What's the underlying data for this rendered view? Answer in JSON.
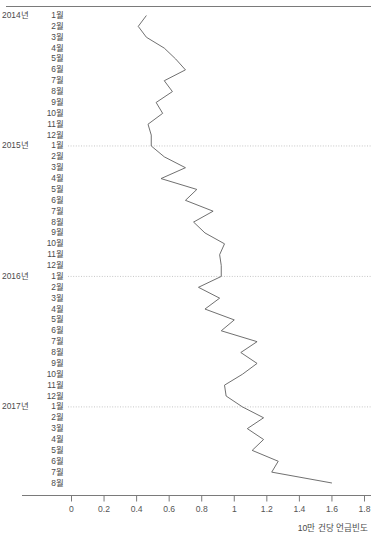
{
  "chart_data": {
    "type": "line",
    "orientation": "horizontal-time-vertical",
    "title": "",
    "xlabel": "10만 건당 언급빈도",
    "ylabel": "",
    "xlim": [
      0,
      1.8
    ],
    "xticks": [
      0,
      0.2,
      0.4,
      0.6,
      0.8,
      1,
      1.2,
      1.4,
      1.6,
      1.8
    ],
    "xtick_labels": [
      "0",
      "0.2",
      "0.4",
      "0.6",
      "0.8",
      "1",
      "1.2",
      "1.4",
      "1.6",
      "1.8"
    ],
    "grid": "horizontal-dotted-at-year-starts",
    "legend": "none",
    "line_color": "#606060",
    "categories": [
      "2014년 1월",
      "2월",
      "3월",
      "4월",
      "5월",
      "6월",
      "7월",
      "8월",
      "9월",
      "10월",
      "11월",
      "12월",
      "2015년 1월",
      "2월",
      "3월",
      "4월",
      "5월",
      "6월",
      "7월",
      "8월",
      "9월",
      "10월",
      "11월",
      "12월",
      "2016년 1월",
      "2월",
      "3월",
      "4월",
      "5월",
      "6월",
      "7월",
      "8월",
      "9월",
      "10월",
      "11월",
      "12월",
      "2017년 1월",
      "2월",
      "3월",
      "4월",
      "5월",
      "6월",
      "7월",
      "8월"
    ],
    "year_rows": [
      {
        "index": 0,
        "year": "2014년",
        "month": "1월"
      },
      {
        "index": 12,
        "year": "2015년",
        "month": "1월"
      },
      {
        "index": 24,
        "year": "2016년",
        "month": "1월"
      },
      {
        "index": 36,
        "year": "2017년",
        "month": "1월"
      }
    ],
    "values": [
      0.46,
      0.41,
      0.46,
      0.57,
      0.64,
      0.7,
      0.57,
      0.62,
      0.52,
      0.56,
      0.47,
      0.49,
      0.49,
      0.57,
      0.7,
      0.55,
      0.77,
      0.7,
      0.87,
      0.75,
      0.82,
      0.94,
      0.91,
      0.92,
      0.92,
      0.78,
      0.91,
      0.82,
      1.0,
      0.92,
      1.14,
      1.04,
      1.14,
      1.05,
      0.94,
      0.95,
      1.05,
      1.18,
      1.08,
      1.18,
      1.11,
      1.27,
      1.23,
      1.6
    ]
  },
  "axis": {
    "title_text": "10만 건당 언급빈도"
  }
}
